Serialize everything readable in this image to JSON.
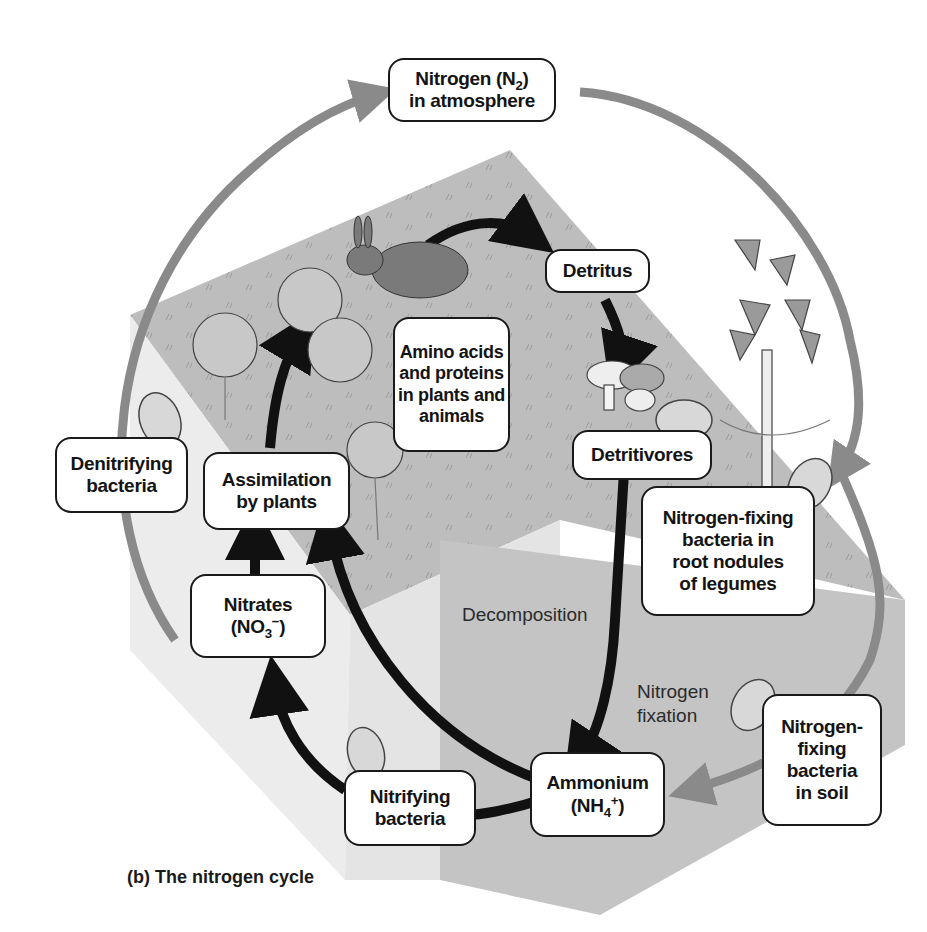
{
  "caption": "(b) The nitrogen cycle",
  "nodes": {
    "atmosphere": {
      "line1": "Nitrogen (N",
      "sub": "2",
      "line1_end": ")",
      "line2": "in atmosphere"
    },
    "detritus": {
      "label": "Detritus"
    },
    "amino_acids": {
      "lines": [
        "Amino acids",
        "and proteins",
        "in plants and",
        "animals"
      ]
    },
    "detritivores": {
      "label": "Detritivores"
    },
    "denitrifying": {
      "lines": [
        "Denitrifying",
        "bacteria"
      ]
    },
    "assimilation": {
      "lines": [
        "Assimilation",
        "by plants"
      ]
    },
    "nitrates": {
      "line1": "Nitrates",
      "pre": "(NO",
      "sub": "3",
      "sup": "−",
      "post": ")"
    },
    "root_nodules": {
      "lines": [
        "Nitrogen-fixing",
        "bacteria in",
        "root nodules",
        "of legumes"
      ]
    },
    "ammonium": {
      "line1": "Ammonium",
      "pre": "(NH",
      "sub": "4",
      "sup": "+",
      "post": ")"
    },
    "nitrifying": {
      "lines": [
        "Nitrifying",
        "bacteria"
      ]
    },
    "soil_fixing": {
      "lines": [
        "Nitrogen-",
        "fixing",
        "bacteria",
        "in soil"
      ]
    }
  },
  "process_labels": {
    "decomposition": "Decomposition",
    "fixation": [
      "Nitrogen",
      "fixation"
    ]
  },
  "colors": {
    "gray_arrow": "#8a8a8a",
    "black_arrow": "#111111",
    "cube_top": "#bdbdbd",
    "cube_left": "#eeeeee",
    "cube_right": "#c6c6c6"
  }
}
